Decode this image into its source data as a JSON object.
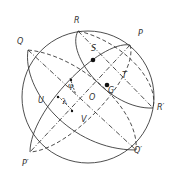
{
  "diagram": {
    "type": "celestial-sphere-geometry",
    "colors": {
      "line": "#3a3a3a",
      "background": "#ffffff",
      "point": "#111111"
    },
    "points": [
      {
        "id": "R",
        "label": "R",
        "x": 78,
        "y": 22
      },
      {
        "id": "P",
        "label": "P",
        "x": 139,
        "y": 34
      },
      {
        "id": "Q",
        "label": "Q",
        "x": 18,
        "y": 42
      },
      {
        "id": "S",
        "label": "S",
        "x": 92,
        "y": 48
      },
      {
        "id": "T",
        "label": "T",
        "x": 122,
        "y": 76
      },
      {
        "id": "G",
        "label": "G",
        "x": 109,
        "y": 90
      },
      {
        "id": "O",
        "label": "O",
        "x": 89,
        "y": 97
      },
      {
        "id": "U",
        "label": "U",
        "x": 39,
        "y": 99
      },
      {
        "id": "V",
        "label": "V",
        "x": 82,
        "y": 119
      },
      {
        "id": "R_prime",
        "label": "R′",
        "x": 157,
        "y": 106
      },
      {
        "id": "Q_prime",
        "label": "Q′",
        "x": 135,
        "y": 150
      },
      {
        "id": "P_prime",
        "label": "P′",
        "x": 22,
        "y": 162
      }
    ],
    "angles": [
      {
        "id": "phi",
        "label": "φ",
        "x": 70,
        "y": 85
      },
      {
        "id": "lambda",
        "label": "λ",
        "x": 62,
        "y": 100
      }
    ]
  }
}
